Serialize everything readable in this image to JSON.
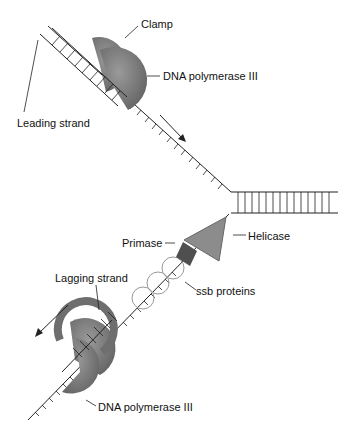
{
  "diagram": {
    "labels": {
      "clamp": "Clamp",
      "dna_pol_top": "DNA polymerase III",
      "leading_strand": "Leading strand",
      "primase": "Primase",
      "helicase": "Helicase",
      "lagging_strand": "Lagging strand",
      "ssb": "ssb proteins",
      "dna_pol_bottom": "DNA polymerase III"
    },
    "colors": {
      "polymerase": "#7a7a7a",
      "helicase": "#8c8c8c",
      "primase": "#4f4f4f",
      "strand": "#222222"
    }
  }
}
